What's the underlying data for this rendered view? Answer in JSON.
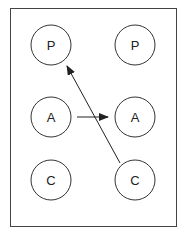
{
  "diagram": {
    "colors": {
      "stroke": "#333333",
      "background": "#ffffff"
    },
    "nodes": [
      {
        "id": "left-p",
        "label": "P",
        "cx": 51,
        "cy": 45
      },
      {
        "id": "right-p",
        "label": "P",
        "cx": 135,
        "cy": 45
      },
      {
        "id": "left-a",
        "label": "A",
        "cx": 51,
        "cy": 117
      },
      {
        "id": "right-a",
        "label": "A",
        "cx": 135,
        "cy": 117
      },
      {
        "id": "left-c",
        "label": "C",
        "cx": 51,
        "cy": 180
      },
      {
        "id": "right-c",
        "label": "C",
        "cx": 135,
        "cy": 180
      }
    ],
    "edges": [
      {
        "from": "left-a",
        "to": "right-a"
      },
      {
        "from": "right-c",
        "to": "left-p"
      }
    ]
  }
}
